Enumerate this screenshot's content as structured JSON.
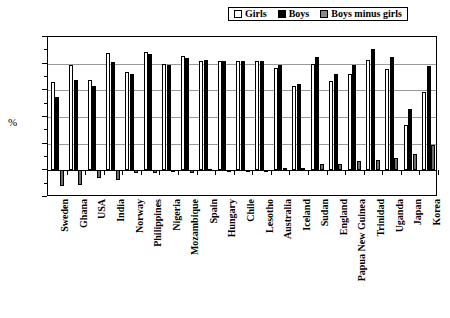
{
  "chart_data": {
    "type": "bar",
    "title": "",
    "subtitle": "",
    "xlabel": "",
    "ylabel": "%",
    "ylim": [
      -20,
      100
    ],
    "yticks": [
      100,
      80,
      60,
      40,
      20,
      0,
      -20
    ],
    "ytick_labels": [
      "100",
      "80",
      "60",
      "40",
      "20",
      "0",
      "-20"
    ],
    "grid": true,
    "legend_position": "top-right",
    "categories": [
      "Sweden",
      "Ghana",
      "USA",
      "India",
      "Norway",
      "Philippines",
      "Nigeria",
      "Mozambique",
      "Spain",
      "Hungary",
      "Chile",
      "Lesotho",
      "Australia",
      "Iceland",
      "Sudan",
      "England",
      "Papua New Guinea",
      "Trinidad",
      "Uganda",
      "Japan",
      "Korea"
    ],
    "series": [
      {
        "name": "Girls",
        "color": "#ffffff",
        "values": [
          66,
          79,
          68,
          88,
          74,
          89,
          80,
          86,
          82,
          82,
          82,
          82,
          77,
          63,
          80,
          67,
          72,
          83,
          76,
          34,
          59
        ]
      },
      {
        "name": "Boys",
        "color": "#000000",
        "values": [
          55,
          68,
          63,
          81,
          72,
          87,
          79,
          84,
          83,
          82,
          82,
          82,
          79,
          65,
          85,
          72,
          79,
          91,
          85,
          46,
          78
        ]
      },
      {
        "name": "Boys minus girls",
        "color": "#6f6f6f",
        "values": [
          -12,
          -11,
          -6,
          -7,
          -2,
          -2,
          -1,
          -2,
          1,
          0,
          0,
          0,
          2,
          2,
          5,
          5,
          7,
          8,
          9,
          12,
          19
        ]
      }
    ]
  },
  "legend": {
    "items": [
      {
        "label": "Girls",
        "swatch": "swatch-girls-white"
      },
      {
        "label": "Boys",
        "swatch": "swatch-boys-black"
      },
      {
        "label": "Boys minus girls",
        "swatch": "swatch-diff-gray"
      }
    ]
  },
  "colors": {
    "girls": "#ffffff",
    "boys": "#000000",
    "difference": "#6f6f6f",
    "axis": "#000000",
    "gridline": "#9a9a9a",
    "background": "#ffffff"
  }
}
